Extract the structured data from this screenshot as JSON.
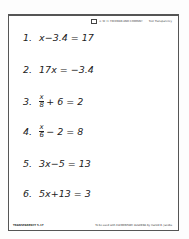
{
  "header": {
    "publisher_line": "© W. H. FREEMAN AND COMPANY",
    "tag": "Text Transparency"
  },
  "equations": [
    {
      "number": "1.",
      "text": "x−3.4 = 17"
    },
    {
      "number": "2.",
      "text": "17x = −3.4"
    },
    {
      "number": "3.",
      "numerator": "x",
      "denominator": "8",
      "rest": "+ 6 = 2"
    },
    {
      "number": "4.",
      "numerator": "x",
      "denominator": "6",
      "rest": "− 2 = 8"
    },
    {
      "number": "5.",
      "text": "3x−5 = 13"
    },
    {
      "number": "6.",
      "text": "5x+13 = 3"
    }
  ],
  "footer": {
    "left": "TRANSPARENCY 5-17",
    "right": "To be used with ELEMENTARY ALGEBRA by Harold R. Jacobs"
  }
}
